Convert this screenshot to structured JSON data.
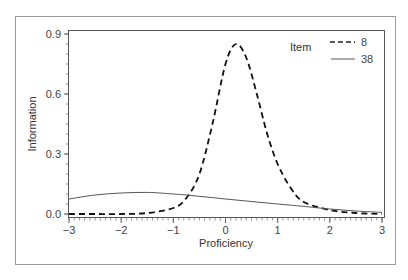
{
  "chart_data": {
    "type": "line",
    "title": "",
    "xlabel": "Proficiency",
    "ylabel": "Information",
    "xlim": [
      -3,
      3
    ],
    "ylim": [
      0,
      0.9
    ],
    "x_ticks": [
      -3,
      -2,
      -1,
      0,
      1,
      2,
      3
    ],
    "x_tick_labels": [
      "−3",
      "−2",
      "−1",
      "0",
      "1",
      "2",
      "3"
    ],
    "y_ticks": [
      0.0,
      0.3,
      0.6,
      0.9
    ],
    "y_tick_labels": [
      "0.0",
      "0.3",
      "0.6",
      "0.9"
    ],
    "grid": false,
    "legend": {
      "title": "Item",
      "position": "top-right",
      "entries": [
        "8",
        "38"
      ]
    },
    "x": [
      -3.0,
      -2.5,
      -2.0,
      -1.5,
      -1.0,
      -0.75,
      -0.5,
      -0.25,
      0.0,
      0.2,
      0.4,
      0.6,
      0.8,
      1.0,
      1.25,
      1.5,
      2.0,
      2.5,
      3.0
    ],
    "series": [
      {
        "name": "8",
        "style": "dashed",
        "values": [
          0.0,
          0.0,
          0.0,
          0.005,
          0.03,
          0.08,
          0.2,
          0.45,
          0.75,
          0.85,
          0.78,
          0.6,
          0.4,
          0.25,
          0.13,
          0.06,
          0.02,
          0.005,
          0.0
        ]
      },
      {
        "name": "38",
        "style": "solid",
        "values": [
          0.075,
          0.095,
          0.105,
          0.108,
          0.1,
          0.095,
          0.088,
          0.082,
          0.075,
          0.07,
          0.065,
          0.06,
          0.055,
          0.05,
          0.044,
          0.038,
          0.025,
          0.015,
          0.008
        ]
      }
    ]
  },
  "legend": {
    "title": "Item",
    "items": [
      {
        "label": "8"
      },
      {
        "label": "38"
      }
    ]
  },
  "axes": {
    "xlabel": "Proficiency",
    "ylabel": "Information"
  }
}
